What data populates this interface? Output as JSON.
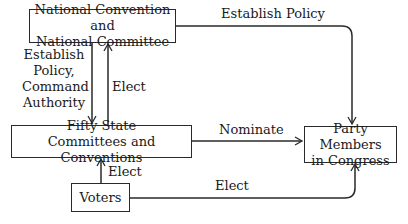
{
  "nodes": {
    "national": {
      "label": "National Convention and National Committee",
      "line1": "National Convention and",
      "line2": "National Committee"
    },
    "state": {
      "label": "Fifty State Committees and Conventions",
      "line1": "Fifty State",
      "line2": "Committees and Conventions"
    },
    "voters": {
      "label": "Voters"
    },
    "congress": {
      "label": "Party Members in Congress",
      "line1": "Party Members",
      "line2": "in Congress"
    }
  },
  "edges": [
    {
      "from": "national",
      "to": "congress",
      "label": "Establish Policy"
    },
    {
      "from": "national",
      "to": "state",
      "label": "Establish Policy, Command Authority",
      "lines": [
        "Establish",
        "Policy,",
        "Command",
        "Authority"
      ]
    },
    {
      "from": "state",
      "to": "national",
      "label": "Elect"
    },
    {
      "from": "state",
      "to": "congress",
      "label": "Nominate"
    },
    {
      "from": "voters",
      "to": "state",
      "label": "Elect"
    },
    {
      "from": "voters",
      "to": "congress",
      "label": "Elect"
    }
  ]
}
